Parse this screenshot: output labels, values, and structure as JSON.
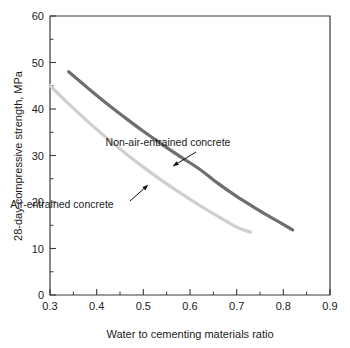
{
  "chart_data": {
    "type": "line",
    "title": "",
    "xlabel": "Water to cementing materials ratio",
    "ylabel": "28-day compressive strength, MPa",
    "xlim": [
      0.3,
      0.9
    ],
    "ylim": [
      0,
      60
    ],
    "grid": false,
    "legend_position": "inline-annotations",
    "x_ticks": [
      "0.3",
      "0.4",
      "0.5",
      "0.6",
      "0.7",
      "0.8",
      "0.9"
    ],
    "x_tick_values": [
      0.3,
      0.4,
      0.5,
      0.6,
      0.7,
      0.8,
      0.9
    ],
    "x_minor_tick_values": [
      0.35,
      0.45,
      0.55,
      0.65,
      0.75,
      0.85
    ],
    "y_ticks": [
      "0",
      "10",
      "20",
      "30",
      "40",
      "50",
      "60"
    ],
    "y_tick_values": [
      0,
      10,
      20,
      30,
      40,
      50,
      60
    ],
    "y_minor_tick_values": [
      5,
      15,
      25,
      35,
      45,
      55
    ],
    "series": [
      {
        "name": "Non-air-entrained concrete",
        "color": "#6e6e6e",
        "line_width": 3.2,
        "x": [
          0.34,
          0.38,
          0.42,
          0.46,
          0.5,
          0.54,
          0.58,
          0.62,
          0.66,
          0.7,
          0.74,
          0.78,
          0.82
        ],
        "y": [
          48.0,
          44.6,
          41.3,
          38.2,
          35.2,
          32.4,
          29.7,
          27.1,
          24.0,
          21.2,
          18.7,
          16.3,
          14.0
        ]
      },
      {
        "name": "Air-entrained concrete",
        "color": "#cfcfcf",
        "line_width": 3.2,
        "x": [
          0.3,
          0.34,
          0.38,
          0.42,
          0.46,
          0.5,
          0.54,
          0.58,
          0.62,
          0.66,
          0.7,
          0.73
        ],
        "y": [
          45.0,
          41.1,
          37.4,
          33.9,
          30.6,
          27.5,
          24.6,
          21.9,
          19.3,
          16.9,
          14.6,
          13.5
        ]
      }
    ],
    "annotations": [
      {
        "text": "Non-air-entrained concrete",
        "text_x": 168,
        "text_y": 146,
        "arrow_from_x": 196,
        "arrow_from_y": 152,
        "arrow_to_x": 173,
        "arrow_to_y": 166
      },
      {
        "text": "Air-entrained concrete",
        "text_x": 62,
        "text_y": 208,
        "arrow_from_x": 130,
        "arrow_from_y": 201,
        "arrow_to_x": 148,
        "arrow_to_y": 185
      }
    ]
  }
}
